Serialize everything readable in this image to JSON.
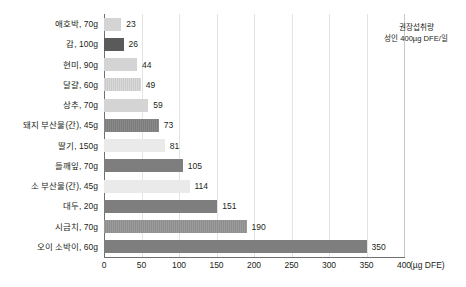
{
  "chart_data": {
    "type": "bar",
    "orientation": "horizontal",
    "title": "",
    "xlabel": "(µg DFE)",
    "ylabel": "",
    "xlim": [
      0,
      400
    ],
    "xticks": [
      0,
      50,
      100,
      150,
      200,
      250,
      300,
      350,
      400
    ],
    "xtick_labels": [
      "0",
      "50",
      "100",
      "150",
      "200",
      "250",
      "300",
      "350",
      "400"
    ],
    "grid": true,
    "legend": null,
    "categories": [
      "애호박, 70g",
      "감, 100g",
      "현미, 90g",
      "달걀, 60g",
      "상추, 70g",
      "돼지 부산물(간), 45g",
      "딸기, 150g",
      "들깨잎, 70g",
      "소 부산물(간), 45g",
      "대두, 20g",
      "시금치, 70g",
      "오이 소박이, 60g"
    ],
    "values": [
      23,
      26,
      44,
      49,
      59,
      73,
      81,
      105,
      114,
      151,
      190,
      350
    ],
    "value_labels": [
      "23",
      "26",
      "44",
      "49",
      "59",
      "73",
      "81",
      "105",
      "114",
      "151",
      "190",
      "350"
    ],
    "bar_styles": [
      "fill-light",
      "fill-darkest",
      "fill-light",
      "fill-stripe-light",
      "fill-light",
      "fill-stripe-dark",
      "fill-pale",
      "fill-dark",
      "fill-pale",
      "fill-dark",
      "fill-stripe-mid",
      "fill-dark"
    ],
    "annotations": [
      {
        "name": "recommended-intake",
        "line1": "권장섭취량",
        "line2": "성인 400µg DFE/일",
        "reference_value": 400
      }
    ],
    "colors": {
      "axis": "#6f6f6f",
      "grid": "#e3e3e3",
      "reference_line": "#c9c9c9",
      "text": "#231f20",
      "bar_light": "#d4d4d4",
      "bar_pale": "#eaeaea",
      "bar_dark": "#7e7e7e",
      "bar_darkest": "#5a5a5a"
    }
  }
}
